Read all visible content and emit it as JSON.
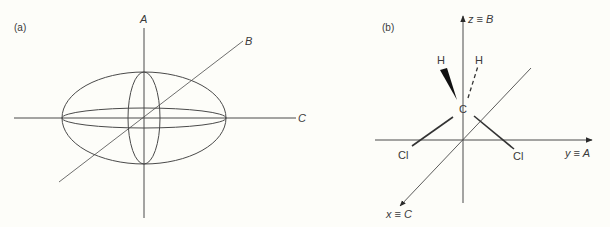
{
  "panel_a": {
    "tag": "(a)",
    "axis_labels": {
      "A": "A",
      "B": "B",
      "C": "C"
    }
  },
  "panel_b": {
    "tag": "(b)",
    "axis_labels": {
      "z": "z ≡ B",
      "y": "y ≡ A",
      "x": "x ≡ C"
    },
    "atoms": {
      "carbon": "C",
      "h_wedge": "H",
      "h_dash": "H",
      "cl_left": "Cl",
      "cl_right": "Cl"
    }
  },
  "colors": {
    "line": "#4a4a4a",
    "background": "#fdfdf9"
  }
}
